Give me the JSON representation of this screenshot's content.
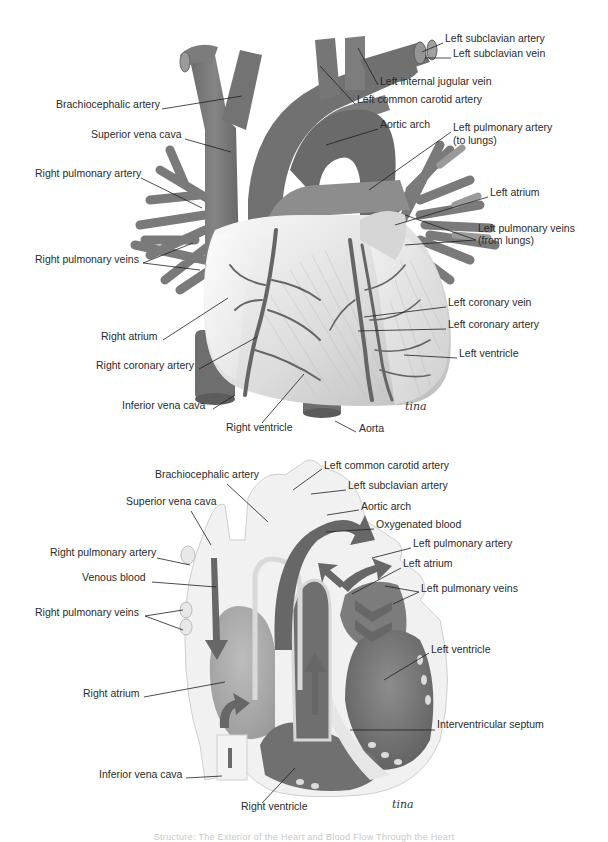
{
  "figure": {
    "caption": "Structure: The Exterior of the Heart and Blood Flow Through the Heart",
    "colors": {
      "vessel": "#7a7a7a",
      "vessel_dark": "#5e5e5e",
      "heart_surface": "#ececec",
      "chamber_dark": "#6a6a6a",
      "chamber_light": "#a9a9a9",
      "arrow": "#666666",
      "leader": "#1e1e1e"
    },
    "signature": "tina"
  },
  "exterior_view": {
    "labels": [
      {
        "id": "left-subclavian-artery",
        "text": "Left subclavian artery",
        "x": 445,
        "y": 38
      },
      {
        "id": "left-subclavian-vein",
        "text": "Left subclavian vein",
        "x": 453,
        "y": 53
      },
      {
        "id": "left-internal-jugular-vein",
        "text": "Left internal jugular vein",
        "x": 380,
        "y": 81
      },
      {
        "id": "brachiocephalic-artery",
        "text": "Brachiocephalic artery",
        "x": 56,
        "y": 104
      },
      {
        "id": "left-common-carotid-artery",
        "text": "Left common carotid artery",
        "x": 357,
        "y": 99
      },
      {
        "id": "aortic-arch",
        "text": "Aortic arch",
        "x": 380,
        "y": 124
      },
      {
        "id": "left-pulmonary-artery",
        "text": "Left pulmonary artery",
        "x": 453,
        "y": 127
      },
      {
        "id": "left-pulmonary-artery-note",
        "text": "(to lungs)",
        "x": 453,
        "y": 140
      },
      {
        "id": "superior-vena-cava",
        "text": "Superior vena cava",
        "x": 91,
        "y": 134
      },
      {
        "id": "right-pulmonary-artery",
        "text": "Right pulmonary artery",
        "x": 35,
        "y": 173
      },
      {
        "id": "left-atrium",
        "text": "Left atrium",
        "x": 490,
        "y": 192
      },
      {
        "id": "left-pulmonary-veins",
        "text": "Left pulmonary veins",
        "x": 478,
        "y": 228
      },
      {
        "id": "left-pulmonary-veins-note",
        "text": "(from lungs)",
        "x": 478,
        "y": 240
      },
      {
        "id": "right-pulmonary-veins",
        "text": "Right pulmonary veins",
        "x": 35,
        "y": 259
      },
      {
        "id": "left-coronary-vein",
        "text": "Left coronary vein",
        "x": 448,
        "y": 302
      },
      {
        "id": "left-coronary-artery",
        "text": "Left coronary artery",
        "x": 448,
        "y": 324
      },
      {
        "id": "right-atrium",
        "text": "Right atrium",
        "x": 101,
        "y": 336
      },
      {
        "id": "left-ventricle",
        "text": "Left ventricle",
        "x": 459,
        "y": 353
      },
      {
        "id": "right-coronary-artery",
        "text": "Right coronary artery",
        "x": 96,
        "y": 365
      },
      {
        "id": "inferior-vena-cava",
        "text": "Inferior vena cava",
        "x": 122,
        "y": 405
      },
      {
        "id": "right-ventricle",
        "text": "Right ventricle",
        "x": 226,
        "y": 427
      },
      {
        "id": "aorta",
        "text": "Aorta",
        "x": 359,
        "y": 428
      }
    ]
  },
  "blood_flow_view": {
    "labels": [
      {
        "id": "left-common-carotid-artery",
        "text": "Left common carotid artery",
        "x": 324,
        "y": 465
      },
      {
        "id": "brachiocephalic-artery",
        "text": "Brachiocephalic artery",
        "x": 155,
        "y": 474
      },
      {
        "id": "left-subclavian-artery",
        "text": "Left subclavian artery",
        "x": 348,
        "y": 485
      },
      {
        "id": "superior-vena-cava",
        "text": "Superior vena cava",
        "x": 126,
        "y": 501
      },
      {
        "id": "aortic-arch",
        "text": "Aortic arch",
        "x": 361,
        "y": 506
      },
      {
        "id": "oxygenated-blood",
        "text": "Oxygenated blood",
        "x": 376,
        "y": 524
      },
      {
        "id": "right-pulmonary-artery",
        "text": "Right pulmonary artery",
        "x": 50,
        "y": 552
      },
      {
        "id": "left-pulmonary-artery",
        "text": "Left pulmonary artery",
        "x": 413,
        "y": 543
      },
      {
        "id": "venous-blood",
        "text": "Venous blood",
        "x": 82,
        "y": 577
      },
      {
        "id": "left-atrium",
        "text": "Left atrium",
        "x": 403,
        "y": 563
      },
      {
        "id": "left-pulmonary-veins",
        "text": "Left pulmonary veins",
        "x": 421,
        "y": 588
      },
      {
        "id": "right-pulmonary-veins",
        "text": "Right pulmonary veins",
        "x": 35,
        "y": 612
      },
      {
        "id": "left-ventricle",
        "text": "Left ventricle",
        "x": 431,
        "y": 649
      },
      {
        "id": "right-atrium",
        "text": "Right atrium",
        "x": 83,
        "y": 693
      },
      {
        "id": "interventricular-septum",
        "text": "Interventricular septum",
        "x": 437,
        "y": 724
      },
      {
        "id": "inferior-vena-cava",
        "text": "Inferior vena cava",
        "x": 99,
        "y": 774
      },
      {
        "id": "right-ventricle",
        "text": "Right ventricle",
        "x": 241,
        "y": 806
      }
    ]
  }
}
